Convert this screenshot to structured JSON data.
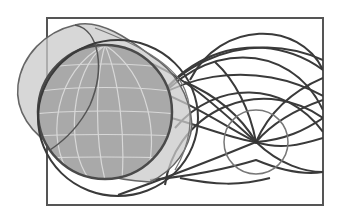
{
  "illustration": {
    "title": "Globe with signal wave propagation",
    "caption": "",
    "canvas": {
      "width": 342,
      "height": 214
    },
    "colors": {
      "background": "#ffffff",
      "frame_stroke": "#555555",
      "globe_fill": "#a9a9a9",
      "globe_stroke": "#4a4a4a",
      "grid_lines": "#d8d8d8",
      "lens_fill": "#c9c9c9",
      "lens_stroke": "#666666",
      "wave_stroke": "#3a3a3a",
      "focus_circle_stroke": "#777777"
    },
    "frame": {
      "x": 47,
      "y": 18,
      "width": 276,
      "height": 187
    },
    "globe": {
      "cx": 105,
      "cy": 112,
      "r": 67
    },
    "outer_ring": {
      "cx": 118,
      "cy": 118,
      "rx": 80,
      "ry": 78
    },
    "focus_point": {
      "x": 256,
      "y": 142,
      "small_circle_r": 32
    },
    "elements": [
      "frame-rectangle",
      "globe-with-lat-long-grid",
      "translucent-cone-lens",
      "outer-ring",
      "wave-arcs",
      "focus-circle"
    ]
  }
}
